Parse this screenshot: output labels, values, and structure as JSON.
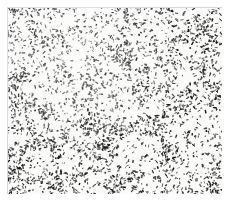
{
  "image": {
    "title": "Untitled (Speckled Field)",
    "medium": "ink marks on paper",
    "subject": "dense allover field of small irregular black marks",
    "width_px": 231,
    "height_px": 203,
    "orientation": "landscape"
  },
  "canvas": {
    "background_color": "#ffffff",
    "paper_color": "#fbfbf9",
    "mark_color": "#151515",
    "edge_color": "#d8d8d4",
    "margin": {
      "top": 7,
      "right": 9,
      "bottom": 9,
      "left": 7
    },
    "plate": {
      "x": 7,
      "y": 7,
      "width": 215,
      "height": 187
    }
  },
  "texture": {
    "type": "stipple-noise-field",
    "mark_count": 3400,
    "seed": 20250607,
    "min_length_px": 0.8,
    "max_length_px": 3.6,
    "min_thickness_px": 0.7,
    "max_thickness_px": 1.7,
    "opacity_min": 0.45,
    "opacity_max": 1.0,
    "angle_spread_deg": 180,
    "clump_count": 150,
    "clump_radius_px": 9,
    "clump_fraction": 0.45,
    "density_label": "uniform allover, slight thinning near upper-left"
  },
  "labels": {
    "caption": "Untitled (Speckled Field)"
  }
}
